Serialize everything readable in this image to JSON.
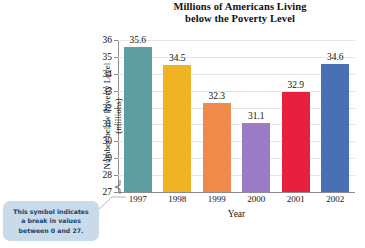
{
  "chart_data": {
    "type": "bar",
    "title": "Millions of Americans Living below the Poverty Level",
    "title_line1": "Millions of Americans Living",
    "title_line2": "below the Poverty Level",
    "xlabel": "Year",
    "ylabel": "Number below Poverty Level (millions)",
    "ylabel_line1": "Number below Poverty Level",
    "ylabel_line2": "(millions)",
    "categories": [
      "1997",
      "1998",
      "1999",
      "2000",
      "2001",
      "2002"
    ],
    "values": [
      35.6,
      34.5,
      32.3,
      31.1,
      32.9,
      34.6
    ],
    "value_labels": [
      "35.6",
      "34.5",
      "32.3",
      "31.1",
      "32.9",
      "34.6"
    ],
    "ylim": [
      27,
      36
    ],
    "yticks": [
      27,
      28,
      29,
      30,
      31,
      32,
      33,
      34,
      35,
      36
    ],
    "ytick_labels": [
      "27",
      "28",
      "29",
      "30",
      "31",
      "32",
      "33",
      "34",
      "35",
      "36"
    ],
    "grid": true,
    "grid_axis": "y",
    "legend": false,
    "axis_break": {
      "present": true,
      "from": 0,
      "to": 27
    },
    "bar_colors": [
      "#5f9ea0",
      "#f0b323",
      "#ef8a4b",
      "#9b7bc4",
      "#e8203f",
      "#4a6fb5"
    ]
  },
  "annotation": {
    "callout_line1": "This symbol indicates",
    "callout_line2": "a break in values",
    "callout_line3": "between 0 and 27.",
    "callout_bg": "#c9dbe8",
    "callout_text_color": "#16406b"
  },
  "colors": {
    "background": "#ffffff",
    "axis": "#8b8b8b",
    "grid": "#dfe7e7",
    "text": "#111111"
  }
}
